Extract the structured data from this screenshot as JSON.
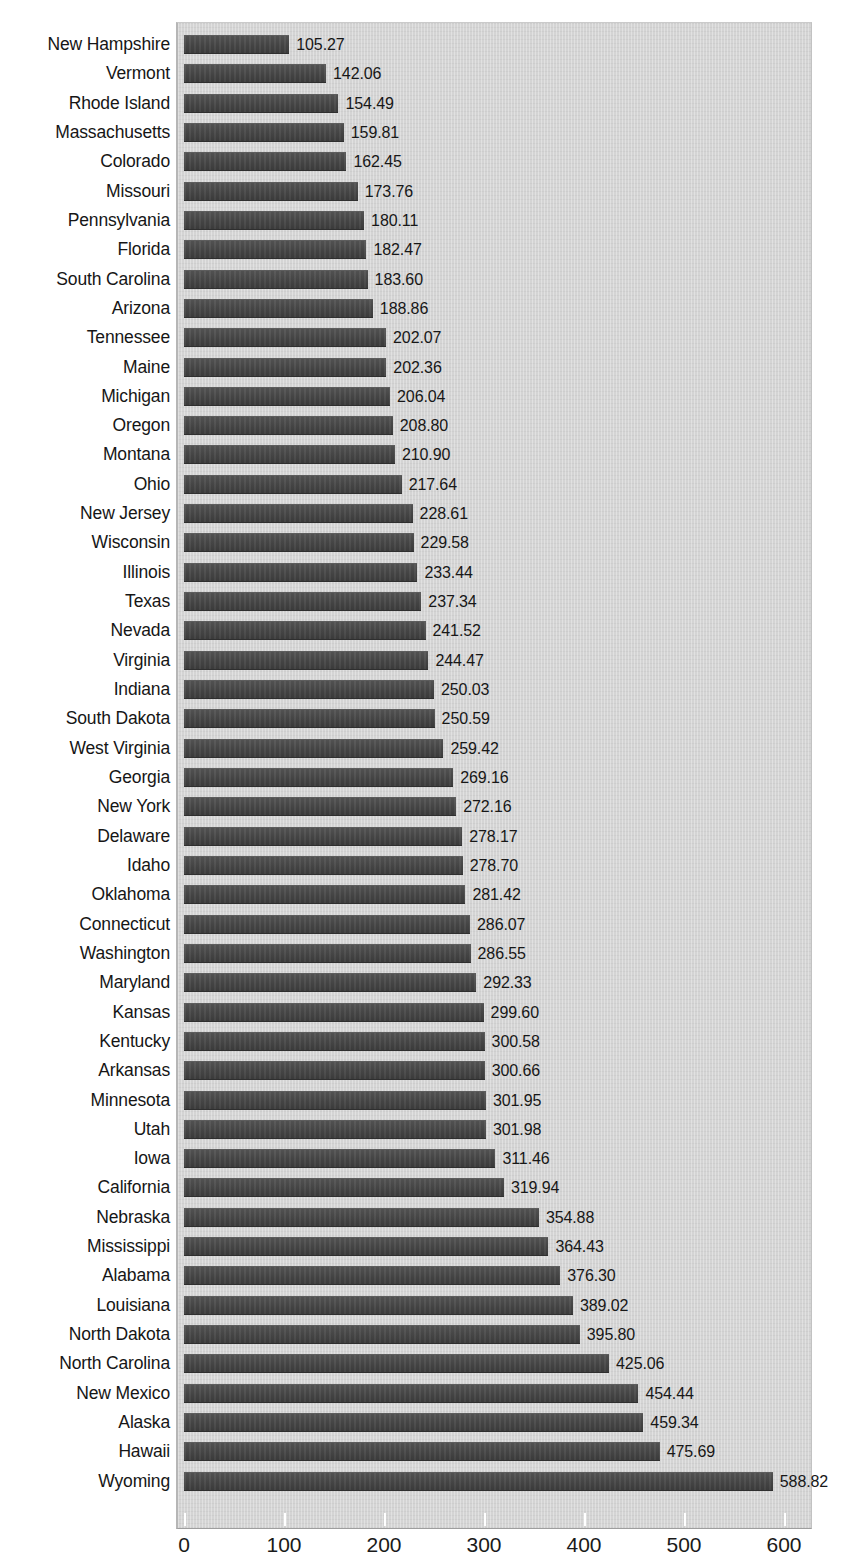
{
  "title_remnant": "",
  "axis": {
    "x_ticks": [
      0,
      100,
      200,
      300,
      400,
      500,
      600
    ],
    "x_tick_labels": [
      "0",
      "100",
      "200",
      "300",
      "400",
      "500",
      "600"
    ],
    "xmin": 0,
    "xmax": 636,
    "pixels_per_unit": 1.0
  },
  "colors": {
    "bar": "#4a4a4a",
    "plot_background": "#d4d4d4",
    "page_background": "#ffffff",
    "text": "#161616",
    "tick": "#ffffff"
  },
  "chart_data": {
    "type": "bar",
    "orientation": "horizontal",
    "title": "",
    "subtitle": "",
    "xlabel": "",
    "ylabel": "",
    "xlim": [
      0,
      636
    ],
    "grid": false,
    "legend": false,
    "sorted": "ascending",
    "value_label_format": "0.00",
    "categories": [
      "New Hampshire",
      "Vermont",
      "Rhode Island",
      "Massachusetts",
      "Colorado",
      "Missouri",
      "Pennsylvania",
      "Florida",
      "South Carolina",
      "Arizona",
      "Tennessee",
      "Maine",
      "Michigan",
      "Oregon",
      "Montana",
      "Ohio",
      "New Jersey",
      "Wisconsin",
      "Illinois",
      "Texas",
      "Nevada",
      "Virginia",
      "Indiana",
      "South Dakota",
      "West Virginia",
      "Georgia",
      "New York",
      "Delaware",
      "Idaho",
      "Oklahoma",
      "Connecticut",
      "Washington",
      "Maryland",
      "Kansas",
      "Kentucky",
      "Arkansas",
      "Minnesota",
      "Utah",
      "Iowa",
      "California",
      "Nebraska",
      "Mississippi",
      "Alabama",
      "Louisiana",
      "North Dakota",
      "North Carolina",
      "New Mexico",
      "Alaska",
      "Hawaii",
      "Wyoming"
    ],
    "values": [
      105.27,
      142.06,
      154.49,
      159.81,
      162.45,
      173.76,
      180.11,
      182.47,
      183.6,
      188.86,
      202.07,
      202.36,
      206.04,
      208.8,
      210.9,
      217.64,
      228.61,
      229.58,
      233.44,
      237.34,
      241.52,
      244.47,
      250.03,
      250.59,
      259.42,
      269.16,
      272.16,
      278.17,
      278.7,
      281.42,
      286.07,
      286.55,
      292.33,
      299.6,
      300.58,
      300.66,
      301.95,
      301.98,
      311.46,
      319.94,
      354.88,
      364.43,
      376.3,
      389.02,
      395.8,
      425.06,
      454.44,
      459.34,
      475.69,
      588.82
    ],
    "value_labels": [
      "105.27",
      "142.06",
      "154.49",
      "159.81",
      "162.45",
      "173.76",
      "180.11",
      "182.47",
      "183.60",
      "188.86",
      "202.07",
      "202.36",
      "206.04",
      "208.80",
      "210.90",
      "217.64",
      "228.61",
      "229.58",
      "233.44",
      "237.34",
      "241.52",
      "244.47",
      "250.03",
      "250.59",
      "259.42",
      "269.16",
      "272.16",
      "278.17",
      "278.70",
      "281.42",
      "286.07",
      "286.55",
      "292.33",
      "299.60",
      "300.58",
      "300.66",
      "301.95",
      "301.98",
      "311.46",
      "319.94",
      "354.88",
      "364.43",
      "376.30",
      "389.02",
      "395.80",
      "425.06",
      "454.44",
      "459.34",
      "475.69",
      "588.82"
    ]
  }
}
